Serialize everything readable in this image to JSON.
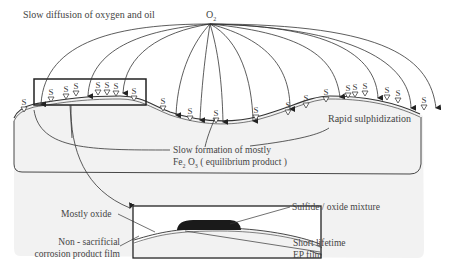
{
  "diagram": {
    "title_source_label": "O2",
    "labels": {
      "slow_diffusion": "Slow diffusion of oxygen and oil",
      "o2_main": "O",
      "o2_sub": "2",
      "rapid_sulphidization": "Rapid sulphidization",
      "slow_formation_line1": "Slow formation of mostly",
      "slow_formation_line2_pre": "Fe",
      "slow_formation_sub1": "2",
      "slow_formation_mid": " O",
      "slow_formation_sub2": "3",
      "slow_formation_post": " ( equilibrium product )",
      "mostly_oxide": "Mostly oxide",
      "non_sacrificial_line1": "Non - sacrificial",
      "non_sacrificial_line2": "corrosion product film",
      "sulfide_oxide_mixture": "Sulfide / oxide mixture",
      "short_lifetime": "Short lifetime",
      "ep_film": "EP film"
    },
    "marker_symbol": "S",
    "colors": {
      "line": "#333333",
      "text": "#444444",
      "surface_fill": "#f2f2f2",
      "deposit": "#1a1a1a"
    },
    "elements": {
      "oxygen_arrows_count": 13,
      "sulfur_markers_count": 22,
      "zoom_inset": "magnified view of surface region"
    }
  }
}
